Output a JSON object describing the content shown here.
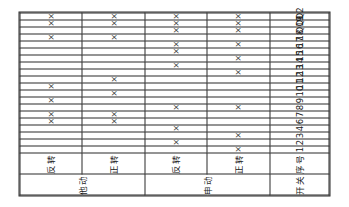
{
  "table": {
    "corner": {
      "top_label": "开关",
      "bottom_label": "序号"
    },
    "bands": [
      {
        "name": "他动",
        "rows": [
          {
            "label": "反转",
            "marks": [
              "6",
              "7",
              "9",
              "11",
              "18",
              "Q1",
              "Q2"
            ]
          },
          {
            "label": "正转",
            "marks": [
              "6",
              "7",
              "10",
              "12",
              "18",
              "Q1",
              "Q2"
            ]
          }
        ]
      },
      {
        "name": "申动",
        "rows": [
          {
            "label": "反转",
            "marks": [
              "2",
              "4",
              "8",
              "14",
              "16",
              "17",
              "Q19",
              "Q1",
              "Q2"
            ]
          },
          {
            "label": "正转",
            "marks": [
              "1",
              "3",
              "8",
              "13",
              "15",
              "17",
              "Q19",
              "Q1",
              "Q2"
            ]
          }
        ]
      }
    ],
    "columns": [
      "1",
      "2",
      "3",
      "4",
      "6",
      "7",
      "8",
      "9",
      "10",
      "11",
      "12",
      "13",
      "14",
      "15",
      "16",
      "17",
      "18",
      "Q19",
      "Q1",
      "Q2"
    ],
    "mark_symbol": "×",
    "colors": {
      "line": "#2b2b2b",
      "text": "#1a1a1a",
      "mark": "#3c3c3c",
      "background": "#ffffff"
    }
  }
}
